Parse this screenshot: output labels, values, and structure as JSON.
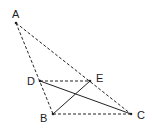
{
  "diagram": {
    "type": "geometry",
    "points": {
      "A": {
        "label": "A",
        "x": 16,
        "y": 23
      },
      "B": {
        "label": "B",
        "x": 53,
        "y": 114
      },
      "C": {
        "label": "C",
        "x": 131,
        "y": 114
      },
      "D": {
        "label": "D",
        "x": 40,
        "y": 81
      },
      "E": {
        "label": "E",
        "x": 90,
        "y": 81
      }
    },
    "segments": [
      {
        "from": "A",
        "to": "B",
        "style": "dashed"
      },
      {
        "from": "A",
        "to": "C",
        "style": "dashed"
      },
      {
        "from": "B",
        "to": "C",
        "style": "dashed"
      },
      {
        "from": "D",
        "to": "E",
        "style": "dashed"
      },
      {
        "from": "D",
        "to": "C",
        "style": "solid"
      },
      {
        "from": "B",
        "to": "E",
        "style": "solid"
      }
    ],
    "colors": {
      "line": "#222222",
      "background": "#ffffff"
    }
  }
}
